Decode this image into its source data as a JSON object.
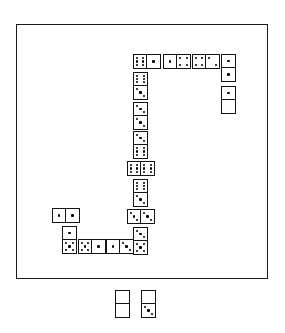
{
  "app": {
    "title": "Dominoes",
    "board_label": "Play Area",
    "hand_label": "Player Hand"
  },
  "colors": {
    "background": "#ffffff",
    "border": "#1a1a1a",
    "tile_face": "#ffffff",
    "pip": "#000000"
  },
  "board": {
    "x": 16,
    "y": 24,
    "width": 252,
    "height": 255
  },
  "tile_size": {
    "long": 28,
    "short": 15
  },
  "chart_data": {
    "type": "table",
    "xlabel": "x (px)",
    "ylabel": "y (px)",
    "columns": [
      "id",
      "a",
      "b",
      "orientation",
      "x",
      "y"
    ],
    "rows": [
      [
        "t1",
        6,
        1,
        "h",
        132,
        53
      ],
      [
        "t2",
        1,
        4,
        "h",
        162,
        53
      ],
      [
        "t3",
        4,
        2,
        "h",
        191,
        53
      ],
      [
        "t4",
        1,
        1,
        "v",
        220,
        53
      ],
      [
        "t5",
        1,
        0,
        "v",
        220,
        85
      ],
      [
        "t6",
        6,
        3,
        "v",
        132,
        71
      ],
      [
        "t7",
        3,
        3,
        "v",
        132,
        101
      ],
      [
        "t8",
        3,
        6,
        "v",
        132,
        130
      ],
      [
        "t9",
        6,
        6,
        "h",
        126,
        160
      ],
      [
        "t10",
        6,
        3,
        "v",
        132,
        178
      ],
      [
        "t11",
        3,
        3,
        "h",
        126,
        208
      ],
      [
        "t12",
        3,
        5,
        "v",
        132,
        226
      ],
      [
        "t13",
        1,
        1,
        "h",
        51,
        207
      ],
      [
        "t14",
        1,
        5,
        "v",
        61,
        225
      ],
      [
        "t15",
        5,
        1,
        "h",
        77,
        238
      ],
      [
        "t16",
        1,
        3,
        "h",
        105,
        238
      ]
    ]
  },
  "tiles": [
    {
      "name": "tile-6-1",
      "a": 6,
      "b": 1,
      "o": "h",
      "x": 132,
      "y": 53
    },
    {
      "name": "tile-1-4",
      "a": 1,
      "b": 4,
      "o": "h",
      "x": 162,
      "y": 53
    },
    {
      "name": "tile-4-2",
      "a": 4,
      "b": 2,
      "o": "h",
      "x": 191,
      "y": 53
    },
    {
      "name": "tile-1-1-right",
      "a": 1,
      "b": 1,
      "o": "v",
      "x": 220,
      "y": 53
    },
    {
      "name": "tile-1-0-right",
      "a": 1,
      "b": 0,
      "o": "v",
      "x": 220,
      "y": 85
    },
    {
      "name": "tile-6-3-upper",
      "a": 6,
      "b": 3,
      "o": "v",
      "x": 132,
      "y": 71
    },
    {
      "name": "tile-3-3-upper",
      "a": 3,
      "b": 3,
      "o": "v",
      "x": 132,
      "y": 101
    },
    {
      "name": "tile-3-6",
      "a": 3,
      "b": 6,
      "o": "v",
      "x": 132,
      "y": 130
    },
    {
      "name": "tile-6-6",
      "a": 6,
      "b": 6,
      "o": "h",
      "x": 126,
      "y": 160
    },
    {
      "name": "tile-6-3-lower",
      "a": 6,
      "b": 3,
      "o": "v",
      "x": 132,
      "y": 178
    },
    {
      "name": "tile-3-3-lower",
      "a": 3,
      "b": 3,
      "o": "h",
      "x": 126,
      "y": 208
    },
    {
      "name": "tile-3-5",
      "a": 3,
      "b": 5,
      "o": "v",
      "x": 132,
      "y": 226
    },
    {
      "name": "tile-1-1-left",
      "a": 1,
      "b": 1,
      "o": "h",
      "x": 51,
      "y": 207
    },
    {
      "name": "tile-1-5",
      "a": 1,
      "b": 5,
      "o": "v",
      "x": 61,
      "y": 225
    },
    {
      "name": "tile-5-1",
      "a": 5,
      "b": 1,
      "o": "h",
      "x": 77,
      "y": 238
    },
    {
      "name": "tile-1-3",
      "a": 1,
      "b": 3,
      "o": "h",
      "x": 105,
      "y": 238
    }
  ],
  "hand": [
    {
      "name": "hand-tile-0-0",
      "a": 0,
      "b": 0,
      "o": "v",
      "x": 115,
      "y": 290
    },
    {
      "name": "hand-tile-0-3",
      "a": 0,
      "b": 3,
      "o": "v",
      "x": 141,
      "y": 290
    }
  ]
}
